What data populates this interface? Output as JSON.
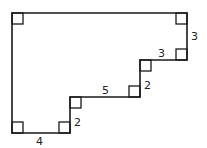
{
  "diagram": {
    "type": "rectilinear-polygon",
    "stroke_color": "#1a1a1a",
    "background": "#ffffff",
    "vertices": [
      [
        12,
        13
      ],
      [
        187,
        13
      ],
      [
        187,
        60
      ],
      [
        140,
        60
      ],
      [
        140,
        97
      ],
      [
        70,
        97
      ],
      [
        70,
        133
      ],
      [
        12,
        133
      ]
    ],
    "right_angle_markers": [
      {
        "corner": "top-left",
        "x": 12,
        "y": 13,
        "dx": 1,
        "dy": 1
      },
      {
        "corner": "top-right",
        "x": 187,
        "y": 13,
        "dx": -1,
        "dy": 1
      },
      {
        "corner": "right-step-bottom",
        "x": 187,
        "y": 60,
        "dx": -1,
        "dy": -1
      },
      {
        "corner": "step1-inner",
        "x": 140,
        "y": 60,
        "dx": 1,
        "dy": 1
      },
      {
        "corner": "step1-outer",
        "x": 140,
        "y": 97,
        "dx": -1,
        "dy": -1
      },
      {
        "corner": "step2-inner",
        "x": 70,
        "y": 97,
        "dx": 1,
        "dy": 1
      },
      {
        "corner": "step2-outer",
        "x": 70,
        "y": 133,
        "dx": -1,
        "dy": -1
      },
      {
        "corner": "bottom-left",
        "x": 12,
        "y": 133,
        "dx": 1,
        "dy": -1
      }
    ],
    "labels": [
      {
        "id": "right-side",
        "text": "3",
        "x": 191,
        "y": 40
      },
      {
        "id": "upper-step-top",
        "text": "3",
        "x": 158,
        "y": 57
      },
      {
        "id": "upper-step-riser",
        "text": "2",
        "x": 144,
        "y": 89
      },
      {
        "id": "middle-step-top",
        "text": "5",
        "x": 102,
        "y": 94
      },
      {
        "id": "lower-step-riser",
        "text": "2",
        "x": 74,
        "y": 126
      },
      {
        "id": "bottom-side",
        "text": "4",
        "x": 36,
        "y": 145
      }
    ]
  }
}
